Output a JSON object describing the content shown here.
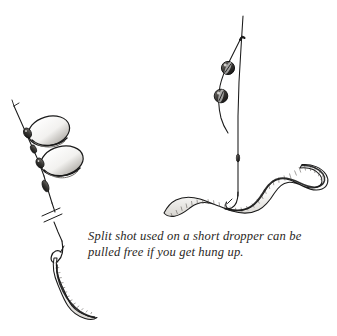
{
  "figure": {
    "kind": "pen-and-ink line drawing",
    "background_color": "#ffffff",
    "ink_color": "#1a1a1a",
    "caption": {
      "lines": [
        "Split shot used on a short dropper can be",
        "pulled free if you get hung up."
      ],
      "full_text": "Split shot used on a short dropper can be pulled free if you get hung up.",
      "style": "italic serif",
      "color": "#2a2724"
    },
    "left_rig": {
      "label": "split shot pinched on loop droppers",
      "main_line_label": "monofilament main line",
      "break_mark_label": "line break mark",
      "split_shot_count": 2,
      "split_shot_shape": "oval loop",
      "terminal_label": "hook with worm bait",
      "worm_count": 1
    },
    "right_rig": {
      "label": "split shot on a short dropper",
      "main_line_label": "monofilament main line",
      "dropper_label": "short dropper strand",
      "split_shot_count": 2,
      "split_shot_shape": "round pinched shot",
      "terminal_label": "hook with worm bait",
      "worm_count": 1
    }
  }
}
